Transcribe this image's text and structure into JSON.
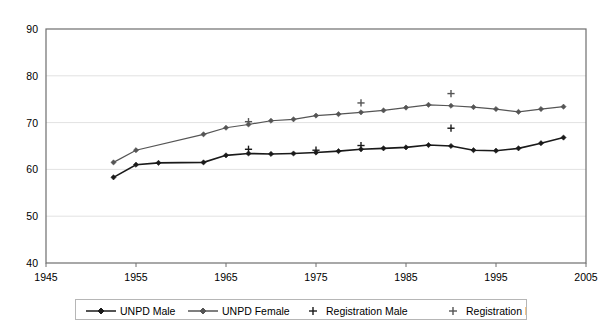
{
  "chart_data": {
    "type": "line",
    "title": "",
    "xlabel": "",
    "ylabel": "",
    "xlim": [
      1945,
      2005
    ],
    "ylim": [
      40,
      90
    ],
    "xticks": [
      1945,
      1955,
      1965,
      1975,
      1985,
      1995,
      2005
    ],
    "yticks": [
      40,
      50,
      60,
      70,
      80,
      90
    ],
    "grid": "horizontal",
    "legend_position": "bottom",
    "series": [
      {
        "name": "UNPD Male",
        "marker": "diamond",
        "color": "#1a1a1a",
        "linewidth": 1.6,
        "points": [
          [
            1952.5,
            58.3
          ],
          [
            1955.0,
            61.0
          ],
          [
            1957.5,
            61.4
          ],
          [
            1962.5,
            61.5
          ],
          [
            1965.0,
            63.0
          ],
          [
            1967.5,
            63.4
          ],
          [
            1970.0,
            63.3
          ],
          [
            1972.5,
            63.4
          ],
          [
            1975.0,
            63.6
          ],
          [
            1977.5,
            63.9
          ],
          [
            1980.0,
            64.3
          ],
          [
            1982.5,
            64.5
          ],
          [
            1985.0,
            64.7
          ],
          [
            1987.5,
            65.2
          ],
          [
            1990.0,
            65.0
          ],
          [
            1992.5,
            64.1
          ],
          [
            1995.0,
            64.0
          ],
          [
            1997.5,
            64.5
          ],
          [
            2000.0,
            65.6
          ],
          [
            2002.5,
            66.8
          ]
        ]
      },
      {
        "name": "UNPD Female",
        "marker": "diamond",
        "color": "#555555",
        "linewidth": 1.2,
        "points": [
          [
            1952.5,
            61.5
          ],
          [
            1955.0,
            64.1
          ],
          [
            1962.5,
            67.5
          ],
          [
            1965.0,
            68.9
          ],
          [
            1967.5,
            69.6
          ],
          [
            1970.0,
            70.4
          ],
          [
            1972.5,
            70.7
          ],
          [
            1975.0,
            71.5
          ],
          [
            1977.5,
            71.8
          ],
          [
            1980.0,
            72.2
          ],
          [
            1982.5,
            72.6
          ],
          [
            1985.0,
            73.2
          ],
          [
            1987.5,
            73.8
          ],
          [
            1990.0,
            73.6
          ],
          [
            1992.5,
            73.3
          ],
          [
            1995.0,
            72.9
          ],
          [
            1997.5,
            72.3
          ],
          [
            2000.0,
            72.9
          ],
          [
            2002.5,
            73.4
          ]
        ]
      },
      {
        "name": "Registration Male",
        "marker": "plus",
        "color": "#1a1a1a",
        "linewidth": 0,
        "points": [
          [
            1967.5,
            64.3
          ],
          [
            1975.0,
            64.1
          ],
          [
            1980.0,
            65.1
          ],
          [
            1990.0,
            68.8
          ]
        ]
      },
      {
        "name": "Registration Female",
        "marker": "plus",
        "color": "#555555",
        "linewidth": 0,
        "points": [
          [
            1967.5,
            70.2
          ],
          [
            1980.0,
            74.2
          ],
          [
            1990.0,
            76.2
          ]
        ]
      }
    ]
  },
  "legend": {
    "items": [
      {
        "label": "UNPD Male",
        "marker": "diamond-line",
        "color": "#1a1a1a"
      },
      {
        "label": "UNPD Female",
        "marker": "diamond-line",
        "color": "#555555"
      },
      {
        "label": "Registration Male",
        "marker": "plus",
        "color": "#1a1a1a"
      },
      {
        "label": "Registration Female",
        "marker": "plus",
        "color": "#555555"
      }
    ]
  }
}
